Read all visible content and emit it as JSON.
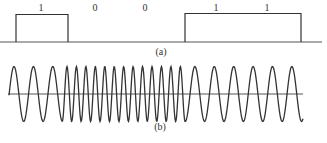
{
  "diagram": {
    "panel_a": {
      "caption": "(a)",
      "bits": [
        {
          "label": "1",
          "x": 41
        },
        {
          "label": "0",
          "x": 95
        },
        {
          "label": "0",
          "x": 145
        },
        {
          "label": "1",
          "x": 216
        },
        {
          "label": "1",
          "x": 267
        }
      ],
      "pulses": [
        {
          "x_start": 16,
          "x_end": 68
        },
        {
          "x_start": 185,
          "x_end": 301
        }
      ]
    },
    "panel_b": {
      "caption": "(b)",
      "segments": [
        {
          "x_start": 14,
          "x_end": 62,
          "frequency": "low"
        },
        {
          "x_start": 62,
          "x_end": 185,
          "frequency": "high"
        },
        {
          "x_start": 185,
          "x_end": 303,
          "frequency": "low"
        }
      ]
    },
    "colors": {
      "stroke": "#333333",
      "axis": "#555555",
      "background": "#ffffff"
    }
  }
}
